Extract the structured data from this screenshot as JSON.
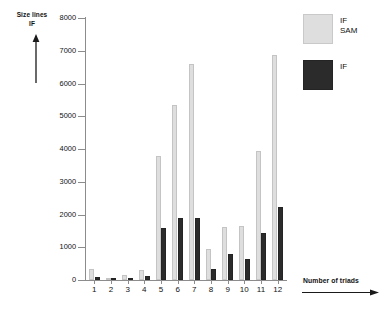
{
  "axes": {
    "y_label_line1": "Size lines",
    "y_label_line2": "IF",
    "x_label": "Number of triads",
    "y_ticks": [
      "8000",
      "7000",
      "6000",
      "5000",
      "4000",
      "3000",
      "2000",
      "1000",
      "0"
    ],
    "x_ticks": [
      "1",
      "2",
      "3",
      "4",
      "5",
      "6",
      "7",
      "8",
      "9",
      "10",
      "11",
      "12"
    ]
  },
  "legend": {
    "items": [
      {
        "key": "sam",
        "label_line1": "IF",
        "label_line2": "SAM",
        "color": "#dedede"
      },
      {
        "key": "if",
        "label_line1": "IF",
        "label_line2": "",
        "color": "#2b2b2b"
      }
    ]
  },
  "icons": {
    "y_arrow": "arrow-up-icon",
    "x_arrow": "arrow-right-icon"
  },
  "chart_data": {
    "type": "bar",
    "title": "",
    "xlabel": "Number of triads",
    "ylabel": "Size lines IF",
    "ylim": [
      0,
      8000
    ],
    "ytick_step": 1000,
    "grid": false,
    "legend_position": "top-right",
    "categories": [
      "1",
      "2",
      "3",
      "4",
      "5",
      "6",
      "7",
      "8",
      "9",
      "10",
      "11",
      "12"
    ],
    "series": [
      {
        "name": "IF SAM",
        "color": "#dedede",
        "values": [
          330,
          40,
          150,
          300,
          3800,
          5350,
          6600,
          960,
          1630,
          1650,
          3930,
          6860
        ]
      },
      {
        "name": "IF",
        "color": "#2b2b2b",
        "values": [
          90,
          10,
          50,
          110,
          1600,
          1900,
          1880,
          330,
          780,
          640,
          1430,
          2240
        ]
      }
    ]
  }
}
